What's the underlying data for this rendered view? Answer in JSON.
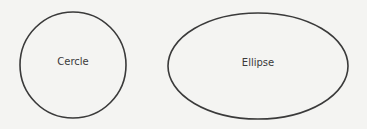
{
  "diagram": {
    "shapes": [
      {
        "type": "circle",
        "label": "Cercle",
        "cx": 73,
        "cy": 65,
        "r": 54
      },
      {
        "type": "ellipse",
        "label": "Ellipse",
        "cx": 258,
        "cy": 66,
        "rx": 90,
        "ry": 53
      }
    ],
    "stroke_color": "#3a3a3a",
    "background": "#f4f4f2"
  }
}
